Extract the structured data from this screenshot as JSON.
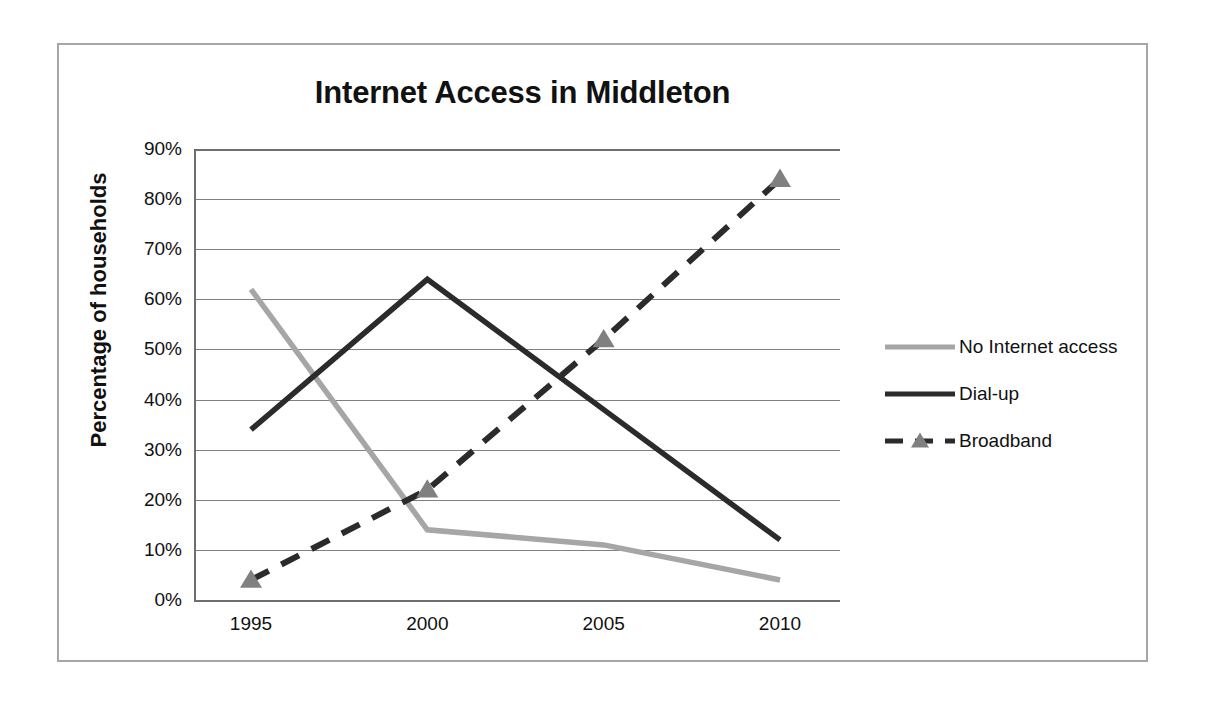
{
  "chart_data": {
    "type": "line",
    "title": "Internet Access in Middleton",
    "xlabel": "",
    "ylabel": "Percentage of households",
    "categories": [
      "1995",
      "2000",
      "2005",
      "2010"
    ],
    "x": [
      1995,
      2000,
      2005,
      2010
    ],
    "ylim": [
      0,
      90
    ],
    "yticks": [
      "0%",
      "10%",
      "20%",
      "30%",
      "40%",
      "50%",
      "60%",
      "70%",
      "80%",
      "90%"
    ],
    "ytick_values": [
      0,
      10,
      20,
      30,
      40,
      50,
      60,
      70,
      80,
      90
    ],
    "grid": true,
    "legend_position": "right",
    "series": [
      {
        "name": "No Internet access",
        "values": [
          62,
          14,
          11,
          4
        ],
        "color": "#a6a6a6",
        "style": "solid",
        "marker": "none"
      },
      {
        "name": "Dial-up",
        "values": [
          34,
          64,
          38,
          12
        ],
        "color": "#2b2b2b",
        "style": "solid",
        "marker": "none"
      },
      {
        "name": "Broadband",
        "values": [
          4,
          22,
          52,
          84
        ],
        "color": "#2b2b2b",
        "style": "dashed",
        "marker": "triangle"
      }
    ]
  },
  "colors": {
    "frame_border": "#a6a6a6",
    "gridline": "#808080",
    "axis": "#6e6e6e",
    "text": "#111111",
    "background": "#ffffff",
    "series_light_gray": "#a6a6a6",
    "series_dark": "#2b2b2b",
    "marker_gray": "#808080"
  }
}
